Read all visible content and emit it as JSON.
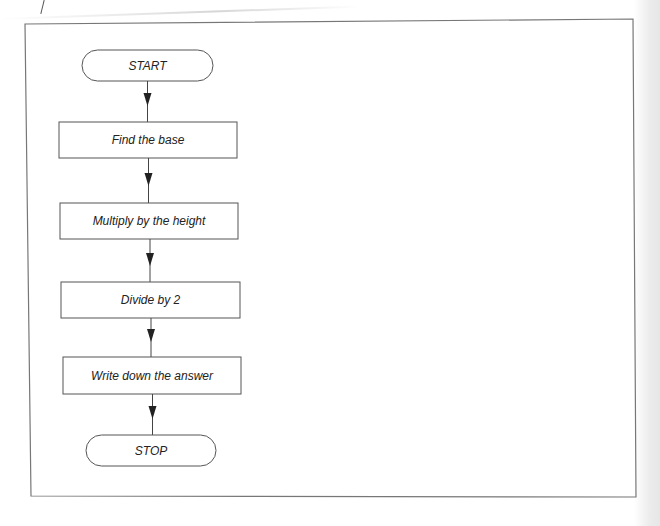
{
  "diagram": {
    "type": "flowchart",
    "direction": "top-to-bottom",
    "nodes": [
      {
        "id": "start",
        "shape": "terminal",
        "label": "START"
      },
      {
        "id": "step1",
        "shape": "process",
        "label": "Find the base"
      },
      {
        "id": "step2",
        "shape": "process",
        "label": "Multiply by the height"
      },
      {
        "id": "step3",
        "shape": "process",
        "label": "Divide by 2"
      },
      {
        "id": "step4",
        "shape": "process",
        "label": "Write down the answer"
      },
      {
        "id": "stop",
        "shape": "terminal",
        "label": "STOP"
      }
    ],
    "edges": [
      {
        "from": "start",
        "to": "step1"
      },
      {
        "from": "step1",
        "to": "step2"
      },
      {
        "from": "step2",
        "to": "step3"
      },
      {
        "from": "step3",
        "to": "step4"
      },
      {
        "from": "step4",
        "to": "stop"
      }
    ]
  },
  "colors": {
    "line": "#444444",
    "frame": "#777777",
    "text": "#222222",
    "background": "#ffffff"
  }
}
